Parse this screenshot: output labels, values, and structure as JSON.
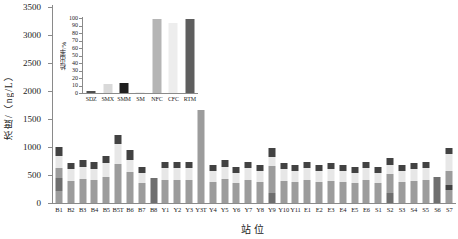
{
  "figure": {
    "background": "#ffffff"
  },
  "chart_data": [
    {
      "type": "bar",
      "subtype": "stacked",
      "title": "",
      "xlabel": "站位",
      "ylabel": "浓度/（ng/L）",
      "ylim": [
        0,
        3500
      ],
      "yticks": [
        0,
        500,
        1000,
        1500,
        2000,
        2500,
        3000,
        3500
      ],
      "grid": false,
      "legend_position": "none",
      "segment_colors": {
        "gray": "#9c9c9c",
        "dark": "#6f6f6f",
        "light": "#e7e7e7",
        "cap": "#424242"
      },
      "categories": [
        "B1",
        "B2",
        "B3",
        "B4",
        "B5",
        "B5T",
        "B6",
        "B7",
        "B8",
        "Y1",
        "Y2",
        "Y3",
        "Y3T",
        "Y4",
        "Y5",
        "Y6",
        "Y7",
        "Y8",
        "Y9",
        "Y10",
        "Y11",
        "E1",
        "E2",
        "E3",
        "E4",
        "E5",
        "E6",
        "S1",
        "S2",
        "S3",
        "S4",
        "S5",
        "S6",
        "S7"
      ],
      "bars": [
        {
          "station": "B1",
          "total": 1000,
          "segments": [
            [
              "gray",
              210
            ],
            [
              "dark",
              230
            ],
            [
              "gray",
              180
            ],
            [
              "light",
              220
            ],
            [
              "cap",
              160
            ]
          ]
        },
        {
          "station": "B2",
          "total": 710,
          "segments": [
            [
              "gray",
              400
            ],
            [
              "light",
              200
            ],
            [
              "cap",
              110
            ]
          ]
        },
        {
          "station": "B3",
          "total": 770,
          "segments": [
            [
              "gray",
              430
            ],
            [
              "light",
              220
            ],
            [
              "cap",
              120
            ]
          ]
        },
        {
          "station": "B4",
          "total": 730,
          "segments": [
            [
              "gray",
              410
            ],
            [
              "light",
              200
            ],
            [
              "cap",
              120
            ]
          ]
        },
        {
          "station": "B5",
          "total": 840,
          "segments": [
            [
              "gray",
              470
            ],
            [
              "light",
              250
            ],
            [
              "cap",
              120
            ]
          ]
        },
        {
          "station": "B5T",
          "total": 1210,
          "segments": [
            [
              "gray",
              700
            ],
            [
              "light",
              350
            ],
            [
              "cap",
              160
            ]
          ]
        },
        {
          "station": "B6",
          "total": 950,
          "segments": [
            [
              "gray",
              560
            ],
            [
              "light",
              210
            ],
            [
              "cap",
              180
            ]
          ]
        },
        {
          "station": "B7",
          "total": 640,
          "segments": [
            [
              "gray",
              360
            ],
            [
              "light",
              180
            ],
            [
              "cap",
              100
            ]
          ]
        },
        {
          "station": "B8",
          "total": 450,
          "segments": [
            [
              "dark",
              450
            ]
          ]
        },
        {
          "station": "Y1",
          "total": 730,
          "segments": [
            [
              "gray",
              410
            ],
            [
              "light",
              210
            ],
            [
              "cap",
              110
            ]
          ]
        },
        {
          "station": "Y2",
          "total": 730,
          "segments": [
            [
              "gray",
              410
            ],
            [
              "light",
              210
            ],
            [
              "cap",
              110
            ]
          ]
        },
        {
          "station": "Y3",
          "total": 730,
          "segments": [
            [
              "gray",
              410
            ],
            [
              "light",
              210
            ],
            [
              "cap",
              110
            ]
          ]
        },
        {
          "station": "Y3T",
          "total": 3300,
          "segments": [
            [
              "gray",
              1980
            ],
            [
              "light",
              1110
            ],
            [
              "cap",
              210
            ]
          ]
        },
        {
          "station": "Y4",
          "total": 680,
          "segments": [
            [
              "gray",
              380
            ],
            [
              "light",
              190
            ],
            [
              "cap",
              110
            ]
          ]
        },
        {
          "station": "Y5",
          "total": 770,
          "segments": [
            [
              "gray",
              430
            ],
            [
              "light",
              220
            ],
            [
              "cap",
              120
            ]
          ]
        },
        {
          "station": "Y6",
          "total": 640,
          "segments": [
            [
              "gray",
              360
            ],
            [
              "light",
              180
            ],
            [
              "cap",
              100
            ]
          ]
        },
        {
          "station": "Y7",
          "total": 730,
          "segments": [
            [
              "gray",
              410
            ],
            [
              "light",
              210
            ],
            [
              "cap",
              110
            ]
          ]
        },
        {
          "station": "Y8",
          "total": 680,
          "segments": [
            [
              "gray",
              380
            ],
            [
              "light",
              190
            ],
            [
              "cap",
              110
            ]
          ]
        },
        {
          "station": "Y9",
          "total": 980,
          "segments": [
            [
              "dark",
              180
            ],
            [
              "gray",
              480
            ],
            [
              "light",
              160
            ],
            [
              "cap",
              160
            ]
          ]
        },
        {
          "station": "Y10",
          "total": 710,
          "segments": [
            [
              "gray",
              400
            ],
            [
              "light",
              200
            ],
            [
              "cap",
              110
            ]
          ]
        },
        {
          "station": "Y11",
          "total": 680,
          "segments": [
            [
              "gray",
              380
            ],
            [
              "light",
              190
            ],
            [
              "cap",
              110
            ]
          ]
        },
        {
          "station": "E1",
          "total": 730,
          "segments": [
            [
              "gray",
              410
            ],
            [
              "light",
              210
            ],
            [
              "cap",
              110
            ]
          ]
        },
        {
          "station": "E2",
          "total": 680,
          "segments": [
            [
              "gray",
              380
            ],
            [
              "light",
              190
            ],
            [
              "cap",
              110
            ]
          ]
        },
        {
          "station": "E3",
          "total": 710,
          "segments": [
            [
              "gray",
              400
            ],
            [
              "light",
              200
            ],
            [
              "cap",
              110
            ]
          ]
        },
        {
          "station": "E4",
          "total": 680,
          "segments": [
            [
              "gray",
              380
            ],
            [
              "light",
              190
            ],
            [
              "cap",
              110
            ]
          ]
        },
        {
          "station": "E5",
          "total": 640,
          "segments": [
            [
              "gray",
              360
            ],
            [
              "light",
              180
            ],
            [
              "cap",
              100
            ]
          ]
        },
        {
          "station": "E6",
          "total": 730,
          "segments": [
            [
              "gray",
              410
            ],
            [
              "light",
              210
            ],
            [
              "cap",
              110
            ]
          ]
        },
        {
          "station": "S1",
          "total": 640,
          "segments": [
            [
              "gray",
              360
            ],
            [
              "light",
              180
            ],
            [
              "cap",
              100
            ]
          ]
        },
        {
          "station": "S2",
          "total": 800,
          "segments": [
            [
              "dark",
              180
            ],
            [
              "gray",
              340
            ],
            [
              "light",
              160
            ],
            [
              "cap",
              120
            ]
          ]
        },
        {
          "station": "S3",
          "total": 680,
          "segments": [
            [
              "gray",
              380
            ],
            [
              "light",
              190
            ],
            [
              "cap",
              110
            ]
          ]
        },
        {
          "station": "S4",
          "total": 710,
          "segments": [
            [
              "gray",
              400
            ],
            [
              "light",
              200
            ],
            [
              "cap",
              110
            ]
          ]
        },
        {
          "station": "S5",
          "total": 730,
          "segments": [
            [
              "gray",
              410
            ],
            [
              "light",
              210
            ],
            [
              "cap",
              110
            ]
          ]
        },
        {
          "station": "S6",
          "total": 460,
          "segments": [
            [
              "dark",
              460
            ]
          ]
        },
        {
          "station": "S7",
          "total": 980,
          "segments": [
            [
              "gray",
              230
            ],
            [
              "cap",
              100
            ],
            [
              "gray",
              250
            ],
            [
              "light",
              300
            ],
            [
              "cap",
              100
            ]
          ]
        }
      ]
    },
    {
      "type": "bar",
      "role": "inset",
      "title": "",
      "xlabel": "",
      "ylabel": "检出率/%",
      "ylim": [
        0,
        100
      ],
      "yticks": [
        0,
        10,
        20,
        30,
        40,
        50,
        60,
        70,
        80,
        90,
        100
      ],
      "grid": false,
      "categories": [
        "SDZ",
        "SMX",
        "SMM",
        "SM",
        "NFC",
        "CFC",
        "RTM"
      ],
      "values": [
        3,
        12,
        13,
        2,
        99,
        93,
        99
      ],
      "bar_colors": [
        "#4f4f4f",
        "#d9d9d9",
        "#1f1f1f",
        "#f0f0f0",
        "#b5b5b5",
        "#ededed",
        "#5e5e5e"
      ]
    }
  ]
}
